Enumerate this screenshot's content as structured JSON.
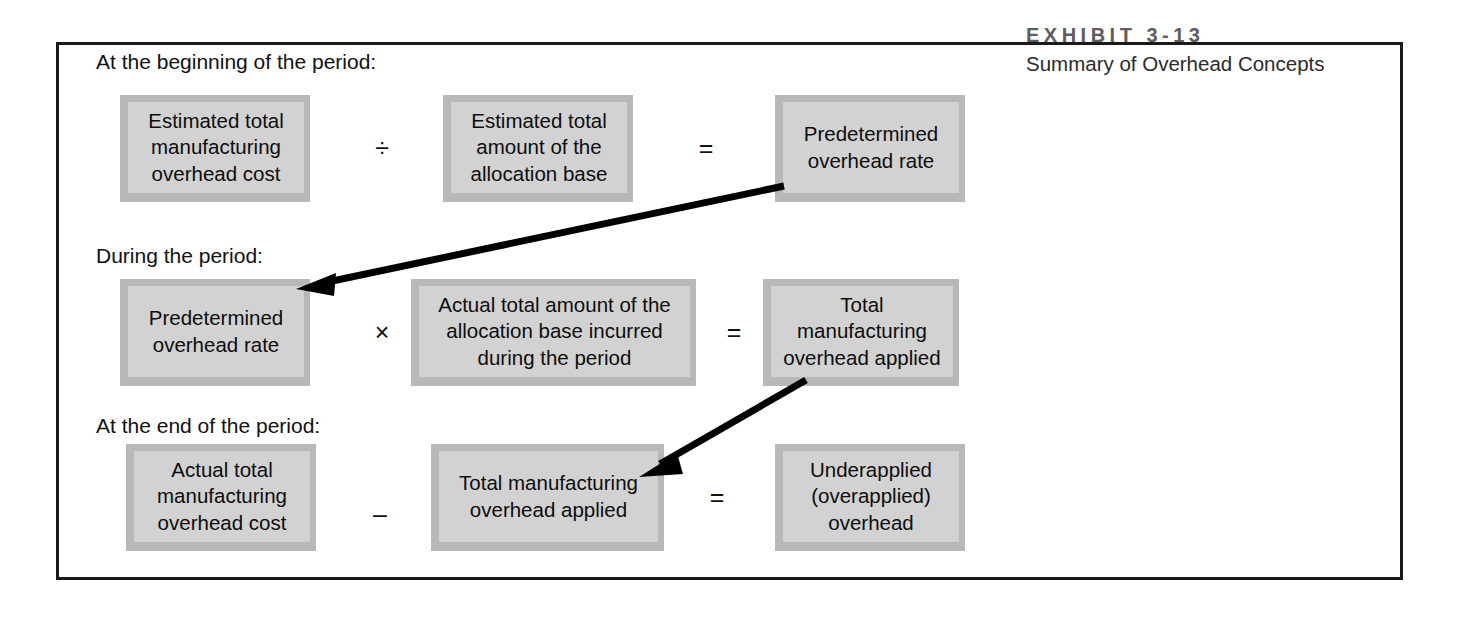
{
  "exhibit": {
    "number": "EXHIBIT 3-13",
    "title": "Summary of Overhead Concepts"
  },
  "sections": [
    {
      "label": "At the beginning of the period:"
    },
    {
      "label": "During the period:"
    },
    {
      "label": "At the end of the period:"
    }
  ],
  "rows": [
    {
      "name": "beginning-of-period",
      "box1": "Estimated total manufacturing overhead cost",
      "operator1": "÷",
      "box2": "Estimated total amount of the allocation base",
      "operator2": "=",
      "box3": "Predetermined overhead rate"
    },
    {
      "name": "during-the-period",
      "box1": "Predetermined overhead rate",
      "operator1": "×",
      "box2": "Actual total amount of the allocation base incurred during the period",
      "operator2": "=",
      "box3": "Total manufacturing overhead applied"
    },
    {
      "name": "end-of-period",
      "box1": "Actual total manufacturing overhead cost",
      "operator1": "–",
      "box2": "Total manufacturing overhead applied",
      "operator2": "=",
      "box3": "Underapplied (overapplied) overhead"
    }
  ],
  "arrows": [
    {
      "name": "predetermined-rate-carry-down-arrow",
      "from": "Predetermined overhead rate",
      "to": "Predetermined overhead rate"
    },
    {
      "name": "overhead-applied-carry-down-arrow",
      "from": "Total manufacturing overhead applied",
      "to": "Total manufacturing overhead applied"
    }
  ],
  "colors": {
    "frame_border": "#1a1a1a",
    "box_fill": "#d2d2d2",
    "box_border": "#b8b8b8",
    "text": "#0d0d0d",
    "exhibit_number": "#5d5d5d",
    "arrow": "#000000",
    "page_background": "#ffffff"
  }
}
